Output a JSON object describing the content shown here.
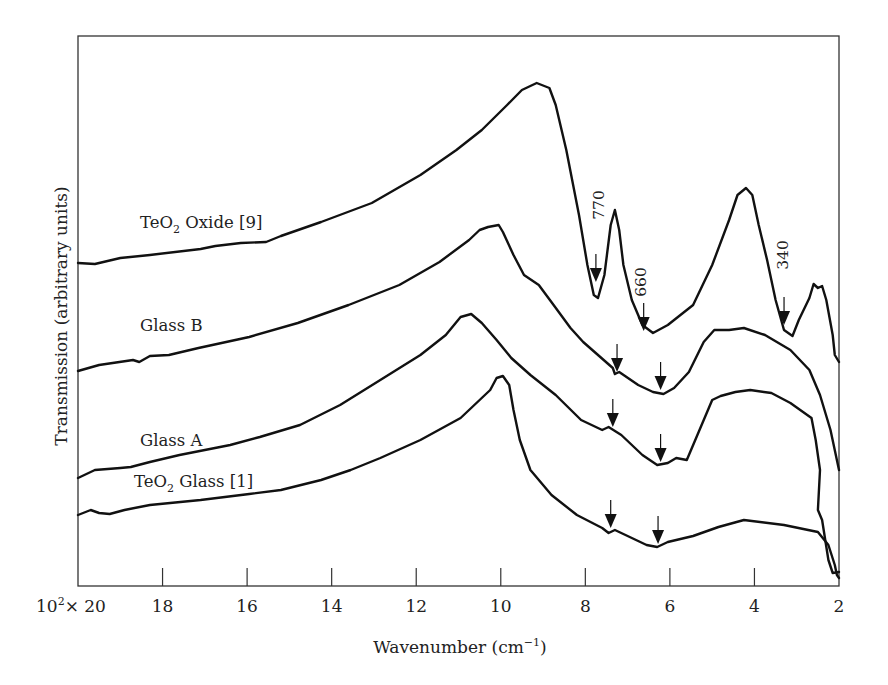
{
  "chart_data": {
    "type": "line",
    "title": "",
    "xlabel": "Wavenumber (cm⁻¹)",
    "ylabel": "Transmission (arbitrary units)",
    "x_scale_prefix": "10²×",
    "x_unit_multiplier": 100,
    "xlim": [
      20,
      2
    ],
    "x_reversed": true,
    "ylim_note": "arbitrary units, curves vertically offset",
    "grid": false,
    "legend": "inline labels",
    "x_ticks": [
      20,
      18,
      16,
      14,
      12,
      10,
      8,
      6,
      4,
      2
    ],
    "x_tick_labels": [
      "10²× 20",
      "18",
      "16",
      "14",
      "12",
      "10",
      "8",
      "6",
      "4",
      "2"
    ],
    "annotations": [
      {
        "text": "770",
        "wavenumber": 770,
        "series": "TeO2 Oxide [9]",
        "rotated": true
      },
      {
        "text": "660",
        "wavenumber": 660,
        "series": "TeO2 Oxide [9]",
        "rotated": true
      },
      {
        "text": "340",
        "wavenumber": 340,
        "series": "TeO2 Oxide [9]",
        "rotated": true
      }
    ],
    "series": [
      {
        "name": "TeO2 Oxide [9]",
        "label_main": "TeO",
        "label_sub": "2",
        "label_rest": " Oxide [9]",
        "label_pos": [
          140,
          223
        ],
        "points": [
          [
            20,
            263
          ],
          [
            19.6,
            264
          ],
          [
            19.0,
            258
          ],
          [
            18.3,
            255
          ],
          [
            17.1,
            249
          ],
          [
            16.75,
            246
          ],
          [
            16.15,
            243
          ],
          [
            15.55,
            242
          ],
          [
            15.2,
            236
          ],
          [
            14.25,
            222
          ],
          [
            13.05,
            203
          ],
          [
            11.9,
            175
          ],
          [
            11.05,
            150
          ],
          [
            10.45,
            130
          ],
          [
            9.85,
            105
          ],
          [
            9.5,
            90
          ],
          [
            9.15,
            83
          ],
          [
            8.85,
            88
          ],
          [
            8.7,
            105
          ],
          [
            8.45,
            150
          ],
          [
            8.15,
            215
          ],
          [
            7.95,
            265
          ],
          [
            7.8,
            295
          ],
          [
            7.7,
            298
          ],
          [
            7.55,
            275
          ],
          [
            7.4,
            225
          ],
          [
            7.3,
            210
          ],
          [
            7.2,
            230
          ],
          [
            7.1,
            265
          ],
          [
            6.9,
            300
          ],
          [
            6.65,
            325
          ],
          [
            6.4,
            333
          ],
          [
            6.05,
            325
          ],
          [
            5.45,
            305
          ],
          [
            5.0,
            265
          ],
          [
            4.6,
            220
          ],
          [
            4.4,
            195
          ],
          [
            4.2,
            188
          ],
          [
            4.05,
            195
          ],
          [
            3.9,
            225
          ],
          [
            3.7,
            260
          ],
          [
            3.5,
            300
          ],
          [
            3.3,
            330
          ],
          [
            3.1,
            336
          ],
          [
            2.95,
            320
          ],
          [
            2.7,
            298
          ],
          [
            2.6,
            284
          ],
          [
            2.5,
            288
          ],
          [
            2.4,
            286
          ],
          [
            2.3,
            300
          ],
          [
            2.15,
            335
          ],
          [
            2.1,
            355
          ],
          [
            2.0,
            362
          ]
        ],
        "arrows": [
          {
            "x": 7.75,
            "y_tip": 282
          },
          {
            "x": 6.62,
            "y_tip": 331
          },
          {
            "x": 3.3,
            "y_tip": 325
          }
        ]
      },
      {
        "name": "Glass B",
        "label_main": "Glass B",
        "label_pos": [
          140,
          330
        ],
        "points": [
          [
            20,
            371
          ],
          [
            19.5,
            365
          ],
          [
            18.7,
            360
          ],
          [
            18.55,
            362
          ],
          [
            18.3,
            356
          ],
          [
            17.85,
            355
          ],
          [
            17.15,
            348
          ],
          [
            15.95,
            337
          ],
          [
            14.8,
            323
          ],
          [
            13.6,
            305
          ],
          [
            12.4,
            285
          ],
          [
            11.45,
            262
          ],
          [
            10.75,
            240
          ],
          [
            10.5,
            230
          ],
          [
            10.3,
            227
          ],
          [
            10.05,
            225
          ],
          [
            9.95,
            232
          ],
          [
            9.7,
            255
          ],
          [
            9.45,
            275
          ],
          [
            9.1,
            285
          ],
          [
            8.75,
            305
          ],
          [
            8.35,
            328
          ],
          [
            8.05,
            342
          ],
          [
            7.7,
            355
          ],
          [
            7.35,
            368
          ],
          [
            7.3,
            374
          ],
          [
            7.2,
            372
          ],
          [
            6.75,
            385
          ],
          [
            6.4,
            392
          ],
          [
            6.15,
            394
          ],
          [
            5.9,
            388
          ],
          [
            5.55,
            372
          ],
          [
            5.2,
            342
          ],
          [
            4.95,
            330
          ],
          [
            4.6,
            330
          ],
          [
            4.25,
            328
          ],
          [
            3.75,
            335
          ],
          [
            3.15,
            350
          ],
          [
            2.7,
            370
          ],
          [
            2.45,
            395
          ],
          [
            2.2,
            430
          ],
          [
            2.0,
            470
          ]
        ],
        "arrows": [
          {
            "x": 7.25,
            "y_tip": 372
          },
          {
            "x": 6.22,
            "y_tip": 390
          }
        ]
      },
      {
        "name": "Glass A",
        "label_main": "Glass A",
        "label_pos": [
          140,
          446
        ],
        "points": [
          [
            20,
            478
          ],
          [
            19.6,
            470
          ],
          [
            19.0,
            468
          ],
          [
            18.75,
            467
          ],
          [
            18.3,
            462
          ],
          [
            17.6,
            455
          ],
          [
            16.4,
            445
          ],
          [
            15.7,
            437
          ],
          [
            14.75,
            425
          ],
          [
            13.8,
            405
          ],
          [
            12.85,
            380
          ],
          [
            11.9,
            355
          ],
          [
            11.3,
            335
          ],
          [
            10.95,
            317
          ],
          [
            10.7,
            314
          ],
          [
            10.45,
            323
          ],
          [
            10.1,
            340
          ],
          [
            9.75,
            358
          ],
          [
            9.3,
            375
          ],
          [
            8.7,
            395
          ],
          [
            8.1,
            420
          ],
          [
            7.6,
            430
          ],
          [
            7.45,
            427
          ],
          [
            7.15,
            435
          ],
          [
            6.65,
            455
          ],
          [
            6.3,
            465
          ],
          [
            6.05,
            463
          ],
          [
            5.85,
            458
          ],
          [
            5.6,
            460
          ],
          [
            5.3,
            430
          ],
          [
            5.0,
            400
          ],
          [
            4.8,
            396
          ],
          [
            4.45,
            392
          ],
          [
            4.1,
            390
          ],
          [
            3.6,
            393
          ],
          [
            3.15,
            403
          ],
          [
            2.65,
            418
          ],
          [
            2.55,
            440
          ],
          [
            2.45,
            470
          ],
          [
            2.5,
            510
          ],
          [
            2.4,
            520
          ],
          [
            2.25,
            560
          ],
          [
            2.15,
            573
          ],
          [
            2.0,
            572
          ]
        ],
        "arrows": [
          {
            "x": 7.35,
            "y_tip": 427
          },
          {
            "x": 6.22,
            "y_tip": 462
          }
        ]
      },
      {
        "name": "TeO2 Glass [1]",
        "label_main": "TeO",
        "label_sub": "2",
        "label_rest": " Glass [1]",
        "label_pos": [
          134,
          487
        ],
        "points": [
          [
            20,
            515
          ],
          [
            19.7,
            510
          ],
          [
            19.5,
            513
          ],
          [
            19.25,
            514
          ],
          [
            18.9,
            510
          ],
          [
            18.3,
            505
          ],
          [
            17.1,
            500
          ],
          [
            15.95,
            494
          ],
          [
            15.2,
            490
          ],
          [
            14.25,
            480
          ],
          [
            13.55,
            470
          ],
          [
            12.85,
            458
          ],
          [
            11.9,
            440
          ],
          [
            10.95,
            418
          ],
          [
            10.25,
            390
          ],
          [
            10.1,
            378
          ],
          [
            9.95,
            376
          ],
          [
            9.8,
            385
          ],
          [
            9.7,
            410
          ],
          [
            9.55,
            440
          ],
          [
            9.3,
            470
          ],
          [
            8.8,
            495
          ],
          [
            8.2,
            515
          ],
          [
            7.6,
            528
          ],
          [
            7.45,
            533
          ],
          [
            7.3,
            530
          ],
          [
            7.05,
            535
          ],
          [
            6.55,
            545
          ],
          [
            6.3,
            547
          ],
          [
            6.05,
            542
          ],
          [
            5.45,
            536
          ],
          [
            4.85,
            527
          ],
          [
            4.25,
            520
          ],
          [
            3.3,
            525
          ],
          [
            2.5,
            532
          ],
          [
            2.25,
            545
          ],
          [
            2.1,
            565
          ],
          [
            2.05,
            575
          ],
          [
            2.0,
            578
          ]
        ],
        "arrows": [
          {
            "x": 7.4,
            "y_tip": 528
          },
          {
            "x": 6.28,
            "y_tip": 544
          }
        ]
      }
    ]
  },
  "axes": {
    "x_title": "Wavenumber (cm",
    "x_title_sup": "−1",
    "x_title_close": ")",
    "y_title": "Transmission (arbitrary units)",
    "x_first_tick_prefix": "10",
    "x_first_tick_sup": "2",
    "x_first_tick_rest": "× 20"
  },
  "labels": {
    "ann_770": "770",
    "ann_660": "660",
    "ann_340": "340",
    "series_0_main": "TeO",
    "series_0_sub": "2",
    "series_0_rest": " Oxide [9]",
    "series_1": "Glass B",
    "series_2": "Glass A",
    "series_3_main": "TeO",
    "series_3_sub": "2",
    "series_3_rest": " Glass [1]"
  },
  "colors": {
    "line": "#111111",
    "frame": "#333333",
    "background": "#ffffff"
  }
}
